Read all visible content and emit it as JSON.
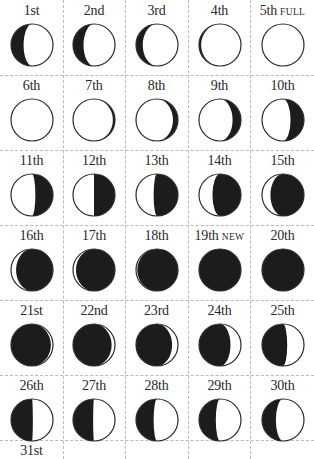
{
  "calendar": {
    "columns": 5,
    "colors": {
      "dark": "#1c1c1c",
      "light": "#ffffff",
      "outline": "#2a2a2a",
      "grid": "#b9b9b9"
    },
    "days": [
      {
        "day": "1st",
        "tag": "",
        "dark_side": "left",
        "dark": 0.3
      },
      {
        "day": "2nd",
        "tag": "",
        "dark_side": "left",
        "dark": 0.25
      },
      {
        "day": "3rd",
        "tag": "",
        "dark_side": "left",
        "dark": 0.16
      },
      {
        "day": "4th",
        "tag": "",
        "dark_side": "left",
        "dark": 0.05
      },
      {
        "day": "5th",
        "tag": "FULL",
        "dark_side": "left",
        "dark": 0.0
      },
      {
        "day": "6th",
        "tag": "",
        "dark_side": "right",
        "dark": 0.0
      },
      {
        "day": "7th",
        "tag": "",
        "dark_side": "right",
        "dark": 0.05
      },
      {
        "day": "8th",
        "tag": "",
        "dark_side": "right",
        "dark": 0.12
      },
      {
        "day": "9th",
        "tag": "",
        "dark_side": "right",
        "dark": 0.2
      },
      {
        "day": "10th",
        "tag": "",
        "dark_side": "right",
        "dark": 0.32
      },
      {
        "day": "11th",
        "tag": "",
        "dark_side": "right",
        "dark": 0.42
      },
      {
        "day": "12th",
        "tag": "",
        "dark_side": "right",
        "dark": 0.5
      },
      {
        "day": "13th",
        "tag": "",
        "dark_side": "right",
        "dark": 0.58
      },
      {
        "day": "14th",
        "tag": "",
        "dark_side": "right",
        "dark": 0.68
      },
      {
        "day": "15th",
        "tag": "",
        "dark_side": "right",
        "dark": 0.8
      },
      {
        "day": "16th",
        "tag": "",
        "dark_side": "right",
        "dark": 0.88
      },
      {
        "day": "17th",
        "tag": "",
        "dark_side": "right",
        "dark": 0.93
      },
      {
        "day": "18th",
        "tag": "",
        "dark_side": "right",
        "dark": 0.97
      },
      {
        "day": "19th",
        "tag": "NEW",
        "dark_side": "right",
        "dark": 1.0
      },
      {
        "day": "20th",
        "tag": "",
        "dark_side": "right",
        "dark": 1.0
      },
      {
        "day": "21st",
        "tag": "",
        "dark_side": "left",
        "dark": 0.95
      },
      {
        "day": "22nd",
        "tag": "",
        "dark_side": "left",
        "dark": 0.92
      },
      {
        "day": "23rd",
        "tag": "",
        "dark_side": "left",
        "dark": 0.86
      },
      {
        "day": "24th",
        "tag": "",
        "dark_side": "left",
        "dark": 0.75
      },
      {
        "day": "25th",
        "tag": "",
        "dark_side": "left",
        "dark": 0.6
      },
      {
        "day": "26th",
        "tag": "",
        "dark_side": "left",
        "dark": 0.52
      },
      {
        "day": "27th",
        "tag": "",
        "dark_side": "left",
        "dark": 0.48
      },
      {
        "day": "28th",
        "tag": "",
        "dark_side": "left",
        "dark": 0.42
      },
      {
        "day": "29th",
        "tag": "",
        "dark_side": "left",
        "dark": 0.4
      },
      {
        "day": "30th",
        "tag": "",
        "dark_side": "left",
        "dark": 0.33
      },
      {
        "day": "31st",
        "tag": "",
        "dark_side": "left",
        "dark": null
      }
    ]
  },
  "layout": {
    "col_x": [
      0,
      63,
      125,
      188,
      251
    ],
    "col_w": [
      63,
      62,
      63,
      63,
      63
    ],
    "row_y": [
      0,
      75,
      150,
      225,
      300,
      375,
      440
    ],
    "row_h": [
      75,
      75,
      75,
      75,
      75,
      65,
      19
    ]
  }
}
